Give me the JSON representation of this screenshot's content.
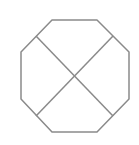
{
  "diagram": {
    "shape": "octagon-with-x",
    "stroke_color": "#8a8a8a",
    "background": "#ffffff",
    "stroke_width": 1.5,
    "octagon_points": "52,20 97,20 129,52 129,99 97,132 52,132 21,99 21,52",
    "diagonal_1": {
      "x1": 36,
      "y1": 36,
      "x2": 113,
      "y2": 116
    },
    "diagonal_2": {
      "x1": 113,
      "y1": 36,
      "x2": 36,
      "y2": 116
    }
  }
}
